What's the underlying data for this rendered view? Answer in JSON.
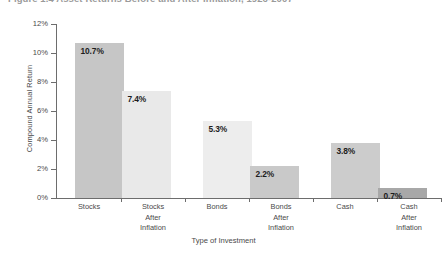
{
  "figure": {
    "title_prefix": "Figure 1.4",
    "title": "Figure 1.4  Asset Returns Before and After Inflation, 1926-2007"
  },
  "chart_data": {
    "type": "bar",
    "title": "Asset Returns Before and After Inflation, 1926-2007",
    "xlabel": "Type of Investment",
    "ylabel": "Compound Annual Return",
    "ylim": [
      0,
      12
    ],
    "ytick_labels": [
      "0%",
      "2%",
      "4%",
      "6%",
      "8%",
      "10%",
      "12%"
    ],
    "ytick_values": [
      0,
      2,
      4,
      6,
      8,
      10,
      12
    ],
    "grid": false,
    "legend": "none",
    "categories": [
      "Stocks",
      "Stocks After Inflation",
      "Bonds",
      "Bonds After Inflation",
      "Cash",
      "Cash After Inflation"
    ],
    "category_lines": [
      [
        "Stocks"
      ],
      [
        "Stocks",
        "After",
        "Inflation"
      ],
      [
        "Bonds"
      ],
      [
        "Bonds",
        "After",
        "Inflation"
      ],
      [
        "Cash"
      ],
      [
        "Cash",
        "After",
        "Inflation"
      ]
    ],
    "values": [
      10.7,
      7.4,
      5.3,
      2.2,
      3.8,
      0.7
    ],
    "value_labels": [
      "10.7%",
      "7.4%",
      "5.3%",
      "2.2%",
      "3.8%",
      "0.7%"
    ],
    "bar_colors": [
      "#c6c6c6",
      "#e9e9e9",
      "#ededed",
      "#c9c9c9",
      "#cccccc",
      "#a8a8a8"
    ],
    "groups": [
      {
        "name": "Stocks",
        "before": 10.7,
        "after": 7.4
      },
      {
        "name": "Bonds",
        "before": 5.3,
        "after": 2.2
      },
      {
        "name": "Cash",
        "before": 3.8,
        "after": 0.7
      }
    ]
  },
  "colors": {
    "axis": "#6d6d6d",
    "text": "#4a4a4a",
    "label": "#1d1d1d",
    "background": "#ffffff"
  }
}
